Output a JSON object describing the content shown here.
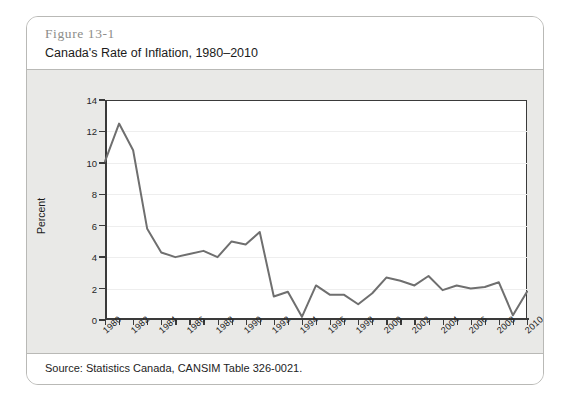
{
  "figure": {
    "number": "Figure 13-1",
    "title": "Canada's Rate of Inflation, 1980–2010",
    "source": "Source: Statistics Canada, CANSIM Table 326-0021."
  },
  "colors": {
    "line": "#6f6f6f",
    "axis": "#3a3a3a",
    "gridline": "#eeeeee",
    "card_background": "#e9e9e7",
    "panel_background": "#ffffff",
    "figure_number_text": "#8d8d8a"
  },
  "chart_data": {
    "type": "line",
    "title": "Canada's Rate of Inflation, 1980–2010",
    "xlabel": "Year",
    "ylabel": "Percent",
    "xlim": [
      1980,
      2010
    ],
    "ylim": [
      0,
      14
    ],
    "ytick_values": [
      0,
      2,
      4,
      6,
      8,
      10,
      12,
      14
    ],
    "ytick_labels": [
      "0",
      "2",
      "4",
      "6",
      "8",
      "10",
      "12",
      "14"
    ],
    "xtick_values": [
      1980,
      1982,
      1984,
      1986,
      1988,
      1990,
      1992,
      1994,
      1996,
      1998,
      2000,
      2002,
      2004,
      2006,
      2008,
      2010
    ],
    "xtick_labels": [
      "1980",
      "1982",
      "1984",
      "1986",
      "1988",
      "1990",
      "1992",
      "1994",
      "1996",
      "1998",
      "2000",
      "2002",
      "2004",
      "2006",
      "2008",
      "2010"
    ],
    "xtick_minor_values": [
      1981,
      1983,
      1985,
      1987,
      1989,
      1991,
      1993,
      1995,
      1997,
      1999,
      2001,
      2003,
      2005,
      2007,
      2009
    ],
    "grid": "horizontal",
    "legend": "none",
    "x": [
      1980,
      1981,
      1982,
      1983,
      1984,
      1985,
      1986,
      1987,
      1988,
      1989,
      1990,
      1991,
      1992,
      1993,
      1994,
      1995,
      1996,
      1997,
      1998,
      1999,
      2000,
      2001,
      2002,
      2003,
      2004,
      2005,
      2006,
      2007,
      2008,
      2009,
      2010
    ],
    "values": [
      10.1,
      12.5,
      10.8,
      5.8,
      4.3,
      4.0,
      4.2,
      4.4,
      4.0,
      5.0,
      4.8,
      5.6,
      1.5,
      1.8,
      0.2,
      2.2,
      1.6,
      1.6,
      1.0,
      1.7,
      2.7,
      2.5,
      2.2,
      2.8,
      1.9,
      2.2,
      2.0,
      2.1,
      2.4,
      0.3,
      1.8
    ],
    "series": [
      {
        "name": "Canada's rate of inflation",
        "values": [
          10.1,
          12.5,
          10.8,
          5.8,
          4.3,
          4.0,
          4.2,
          4.4,
          4.0,
          5.0,
          4.8,
          5.6,
          1.5,
          1.8,
          0.2,
          2.2,
          1.6,
          1.6,
          1.0,
          1.7,
          2.7,
          2.5,
          2.2,
          2.8,
          1.9,
          2.2,
          2.0,
          2.1,
          2.4,
          0.3,
          1.8
        ]
      }
    ]
  }
}
